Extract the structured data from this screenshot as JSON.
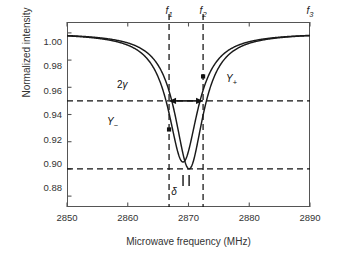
{
  "chart_data": {
    "type": "line",
    "title": "",
    "xlabel": "Microwave frequency (MHz)",
    "ylabel": "Normalized intensity",
    "xlim": [
      2850,
      2890
    ],
    "ylim": [
      0.872,
      1.008
    ],
    "xticks": [
      2850,
      2860,
      2870,
      2880,
      2890
    ],
    "xtick_labels": [
      "2850",
      "2860",
      "2870",
      "2880",
      "2890"
    ],
    "yticks": [
      0.88,
      0.9,
      0.92,
      0.94,
      0.96,
      0.98,
      1.0
    ],
    "ytick_labels": [
      "0.88",
      "0.90",
      "0.92",
      "0.94",
      "0.96",
      "0.98",
      "1.00"
    ],
    "grid": false,
    "legend": "none",
    "series": [
      {
        "name": "Y_minus",
        "label": "Y−",
        "center": 2869.1,
        "depth": 0.095,
        "hwhm": 2.95,
        "baseline": 1.0,
        "color": "#1a1a1a",
        "min_value": 0.905
      },
      {
        "name": "Y_plus",
        "label": "Y+",
        "center": 2870.1,
        "depth": 0.1,
        "hwhm": 2.85,
        "baseline": 1.0,
        "color": "#1a1a1a",
        "min_value": 0.9
      }
    ],
    "vertical_markers": [
      {
        "name": "f1",
        "label": "f₁",
        "x": 2866.8
      },
      {
        "name": "f2",
        "label": "f₂",
        "x": 2872.4
      },
      {
        "name": "f3",
        "label": "f₃",
        "x": 2890.0
      }
    ],
    "horizontal_markers": [
      {
        "name": "half-level",
        "y": 0.95
      },
      {
        "name": "min-level",
        "y": 0.9
      }
    ],
    "annotations": [
      {
        "name": "linewidth-arrow",
        "label": "2γ",
        "y": 0.95,
        "x_start": 2866.8,
        "x_end": 2872.4
      },
      {
        "name": "y-minus-label",
        "label": "Y−",
        "x": 2866.8,
        "y": 0.929
      },
      {
        "name": "y-plus-label",
        "label": "Y+",
        "x": 2872.4,
        "y": 0.968
      },
      {
        "name": "splitting-label",
        "label": "δ",
        "x": 2869.6,
        "y": 0.884
      }
    ],
    "markers": [
      {
        "name": "y-minus-point",
        "x": 2866.8,
        "y": 0.929
      },
      {
        "name": "y-plus-point",
        "x": 2872.4,
        "y": 0.968
      }
    ]
  },
  "axes": {
    "x_title": "Microwave frequency (MHz)",
    "y_title": "Normalized intensity",
    "x_tick_labels": [
      "2850",
      "2860",
      "2870",
      "2880",
      "2890"
    ],
    "y_tick_labels": [
      "0.88",
      "0.90",
      "0.92",
      "0.94",
      "0.96",
      "0.98",
      "1.00"
    ],
    "top_labels": [
      "f",
      "f",
      "f"
    ],
    "top_label_subs": [
      "1",
      "2",
      "3"
    ]
  },
  "labels": {
    "two_gamma_prefix": "2",
    "two_gamma_symbol": "γ",
    "y_minus_base": "Y",
    "y_minus_sub": "−",
    "y_plus_base": "Y",
    "y_plus_sub": "+",
    "delta": "δ"
  },
  "colors": {
    "curve": "#1a1a1a",
    "frame": "#555555",
    "dashed": "#111111",
    "text": "#333333"
  }
}
